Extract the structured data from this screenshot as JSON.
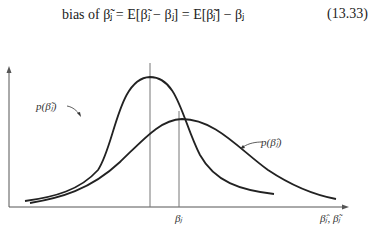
{
  "equation": {
    "text": "bias of β̃ⱼ = E[β̃ⱼ − βⱼ] = E[β̃ⱼ] − βⱼ",
    "number": "(13.33)"
  },
  "figure": {
    "labels": {
      "curve_tilde": "p(β̃ⱼ)",
      "curve_hat": "p(β̂ⱼ)",
      "true_value": "βⱼ",
      "x_axis": "β̂ⱼ, β̃ⱼ"
    },
    "colors": {
      "line": "#222222",
      "axis": "#555555"
    }
  }
}
